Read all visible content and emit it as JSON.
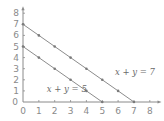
{
  "chart_data": {
    "type": "line",
    "title": "",
    "xlabel": "",
    "ylabel": "",
    "xlim": [
      0,
      8
    ],
    "ylim": [
      0,
      8
    ],
    "grid": false,
    "x_ticks": [
      0,
      1,
      2,
      3,
      4,
      5,
      6,
      7,
      8
    ],
    "y_ticks": [
      0,
      1,
      2,
      3,
      4,
      5,
      6,
      7,
      8
    ],
    "series": [
      {
        "name": "x + y = 7",
        "label": "x + y = 7",
        "points": [
          [
            0,
            7
          ],
          [
            1,
            6
          ],
          [
            2,
            5
          ],
          [
            3,
            4
          ],
          [
            4,
            3
          ],
          [
            5,
            2
          ],
          [
            6,
            1
          ],
          [
            7,
            0
          ]
        ]
      },
      {
        "name": "x + y = 5",
        "label": "x + y = 5",
        "points": [
          [
            0,
            5
          ],
          [
            1,
            4
          ],
          [
            2,
            3
          ],
          [
            3,
            2
          ],
          [
            4,
            1
          ],
          [
            5,
            0
          ]
        ]
      }
    ],
    "annotations": [
      {
        "text": "x + y = 7",
        "x": 5.8,
        "y": 2.4
      },
      {
        "text": "x + y = 5",
        "x": 1.5,
        "y": 0.9
      }
    ]
  },
  "colors": {
    "axis": "#8a8a8a",
    "line": "#8c8c8c",
    "marker": "#7a7a7a",
    "label": "#6a6a6a"
  }
}
